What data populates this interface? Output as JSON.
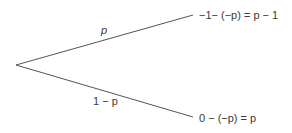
{
  "diagram": {
    "type": "probability-tree",
    "line_color": "#555555",
    "text_color": "#3a3a3a",
    "root": {
      "x": 16,
      "y": 65
    },
    "branches": [
      {
        "id": "upper",
        "probability_label": "p",
        "end": {
          "x": 193,
          "y": 15
        },
        "outcome": "−1− (−p) = p − 1"
      },
      {
        "id": "lower",
        "probability_label": "1 − p",
        "end": {
          "x": 193,
          "y": 117
        },
        "outcome": "0 − (−p) = p"
      }
    ]
  }
}
